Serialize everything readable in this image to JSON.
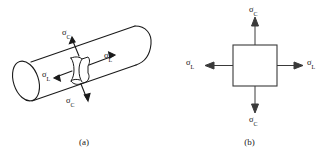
{
  "figure": {
    "background_color": "#ffffff",
    "stroke_color": "#1a1a1a",
    "panels": [
      {
        "id": "a",
        "caption": "(a)",
        "subject": "cylindrical pressure vessel with surface element",
        "labels": [
          {
            "name": "hoop-stress-top",
            "symbol": "σ",
            "subscript": "C",
            "x": 62,
            "y": 28
          },
          {
            "name": "hoop-stress-bottom",
            "symbol": "σ",
            "subscript": "C",
            "x": 66,
            "y": 96
          },
          {
            "name": "longitudinal-stress-right",
            "symbol": "σ",
            "subscript": "L",
            "x": 104,
            "y": 51
          },
          {
            "name": "longitudinal-stress-left",
            "symbol": "σ",
            "subscript": "L",
            "x": 42,
            "y": 70
          }
        ]
      },
      {
        "id": "b",
        "caption": "(b)",
        "subject": "two-dimensional stress element",
        "labels": [
          {
            "name": "hoop-stress-top",
            "symbol": "σ",
            "subscript": "C",
            "x": 75,
            "y": 5
          },
          {
            "name": "hoop-stress-bottom",
            "symbol": "σ",
            "subscript": "C",
            "x": 75,
            "y": 115
          },
          {
            "name": "longitudinal-stress-left",
            "symbol": "σ",
            "subscript": "L",
            "x": 18,
            "y": 58
          },
          {
            "name": "longitudinal-stress-right",
            "symbol": "σ",
            "subscript": "L",
            "x": 140,
            "y": 58
          }
        ]
      }
    ]
  }
}
